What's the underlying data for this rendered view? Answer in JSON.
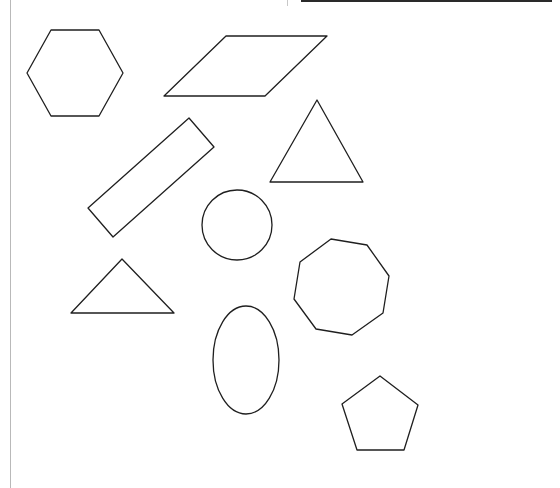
{
  "worksheet": {
    "line_color": "#1f1f1f",
    "background": "#ffffff",
    "table_fragment": {
      "columns": 2
    },
    "shapes": [
      {
        "id": "hexagon",
        "kind": "polygon",
        "points": "51,30 99,30 123,73 99,116 51,116 27,73"
      },
      {
        "id": "parallelogram",
        "kind": "polygon",
        "points": "226,36 327,36 265,96 164,96"
      },
      {
        "id": "triangle-upper",
        "kind": "polygon",
        "points": "317,100 363,182 270,182"
      },
      {
        "id": "rectangle-rotated",
        "kind": "polygon",
        "points": "189,118 214,147 113,237 88,208"
      },
      {
        "id": "circle",
        "kind": "circle",
        "cx": 237,
        "cy": 225,
        "r": 35
      },
      {
        "id": "octagon",
        "kind": "polygon",
        "points": "331,239 367,245 389,276 383,313 352,335 316,329 294,299 300,262"
      },
      {
        "id": "triangle-lower",
        "kind": "polygon",
        "points": "122,259 174,313 71,313"
      },
      {
        "id": "ellipse",
        "kind": "ellipse",
        "cx": 246,
        "cy": 360,
        "rx": 33,
        "ry": 54
      },
      {
        "id": "pentagon",
        "kind": "polygon",
        "points": "380,376 418,405 404,450 357,450 342,404"
      }
    ]
  }
}
